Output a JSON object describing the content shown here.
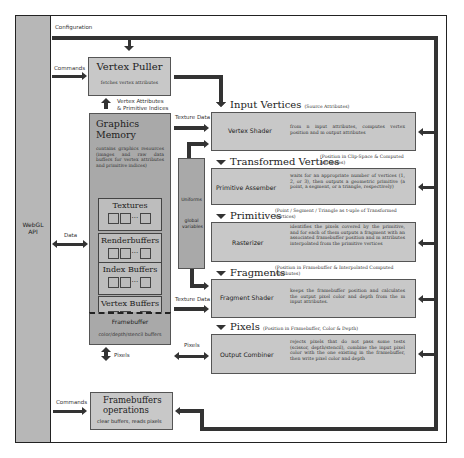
{
  "api": {
    "title": "WebGL API"
  },
  "labels": {
    "configuration": "Configuration",
    "commands_top": "Commands",
    "commands_bottom": "Commands",
    "data": "Data",
    "vertex_attributes": "Vertex Attributes",
    "primitive_indices": "& Primitive Indices",
    "texture_data_top": "Texture Data",
    "texture_data_bottom": "Texture Data",
    "pixels_right": "Pixels",
    "pixels_bottom": "Pixels"
  },
  "vertex_puller": {
    "title": "Vertex Puller",
    "desc": "fetches vertex attributes"
  },
  "graphics_memory": {
    "title": "Graphics Memory",
    "desc": "contains graphics resources (images and raw data buffers for vertex attributes and primitive indices)",
    "buffers": [
      "Textures",
      "Renderbuffers",
      "Index Buffers",
      "Vertex Buffers"
    ],
    "ellipsis": "···",
    "framebuffer": {
      "title": "Framebuffer",
      "desc": "color/depth/stencil buffers"
    }
  },
  "uniforms": {
    "title": "Uniforms",
    "desc": "global variables"
  },
  "framebuffer_ops": {
    "title_line1": "Framebuffers",
    "title_line2": "operations",
    "desc": "clear buffers, reads pixels"
  },
  "pipeline": {
    "data_labels": [
      {
        "title": "Input Vertices",
        "sub": "(Source Attributes)"
      },
      {
        "title": "Transformed Vertices",
        "sub": "(Position in Clip-Space & Computed Attributes)"
      },
      {
        "title": "Primitives",
        "sub": "(Point / Segment / Triangle as t-uple of Transformed Vertices)"
      },
      {
        "title": "Fragments",
        "sub": "(Position in Framebuffer & Interpolated Computed Attributes)"
      },
      {
        "title": "Pixels",
        "sub": "(Position in Framebuffer, Color & Depth)"
      }
    ],
    "stages": [
      {
        "name": "Vertex Shader",
        "desc": "from n input attributes, computes vertex position and m output attributes"
      },
      {
        "name": "Primitive Assember",
        "desc": "waits for an appropriate number of vertices (1, 2, or 3), then outputs a geometric primitive (a point, a segment, or a triangle, respectively)"
      },
      {
        "name": "Rasterizer",
        "desc": "identifies the pixels covered by the primitive, and for each of them outputs a fragment with an associated framebuffer position and m attributes interpolated from the primitive vertices"
      },
      {
        "name": "Fragment Shader",
        "desc": "keeps the framebuffer position and calculates the output pixel color and depth from the m input attributes."
      },
      {
        "name": "Output Combiner",
        "desc": "rejects pixels that do not pass some tests (scissor, depth/stencil), combine the input pixel color with the one existing in the framebuffer, then write pixel color and depth"
      }
    ]
  }
}
